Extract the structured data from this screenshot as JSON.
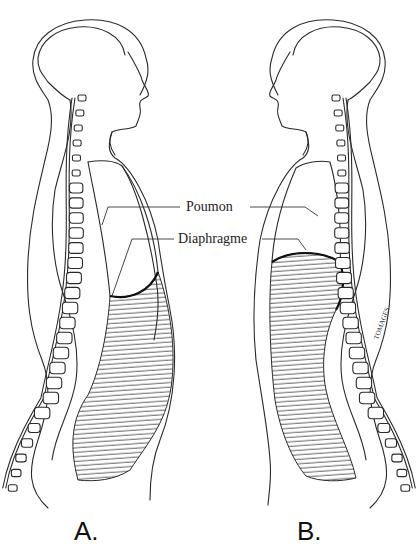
{
  "figure": {
    "labels": {
      "lung": "Poumon",
      "diaphragm": "Diaphragme"
    },
    "panels": [
      {
        "id": "A",
        "caption": "A.",
        "state": "diaphragm relaxed (lower, domed upward into abdomen region shown small)"
      },
      {
        "id": "B",
        "caption": "B.",
        "state": "diaphragm raised"
      }
    ],
    "signature": "TOMAGES"
  },
  "colors": {
    "line": "#2a2a2a",
    "background": "#ffffff"
  }
}
